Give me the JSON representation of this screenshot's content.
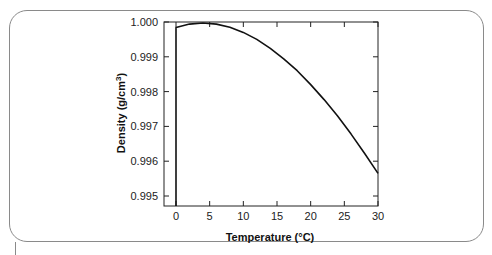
{
  "chart_data": {
    "type": "line",
    "title": "",
    "xlabel": "Temperature (°C)",
    "ylabel": "Density (g/cm³)",
    "xlim": [
      -2,
      30
    ],
    "ylim": [
      0.9947,
      1.0
    ],
    "x_ticks": [
      0,
      5,
      10,
      15,
      20,
      25,
      30
    ],
    "y_ticks": [
      0.995,
      0.996,
      0.997,
      0.998,
      0.999,
      1.0
    ],
    "y_tick_labels": [
      "0.995",
      "0.996",
      "0.997",
      "0.998",
      "0.999",
      "1.000"
    ],
    "grid": false,
    "legend": null,
    "series": [
      {
        "name": "Water density",
        "x": [
          0,
          0,
          2,
          4,
          6,
          8,
          10,
          12,
          14,
          16,
          18,
          20,
          22,
          24,
          26,
          28,
          30
        ],
        "values": [
          0.9947,
          0.99984,
          0.99994,
          0.99997,
          0.99994,
          0.99985,
          0.9997,
          0.9995,
          0.99924,
          0.99894,
          0.9986,
          0.9982,
          0.99777,
          0.9973,
          0.99678,
          0.99623,
          0.99565
        ]
      }
    ]
  },
  "labels": {
    "xlabel_main": "Temperature (",
    "xlabel_unit": "°C)",
    "ylabel_main": "Density (g/cm",
    "ylabel_sup": "3",
    "ylabel_end": ")"
  }
}
